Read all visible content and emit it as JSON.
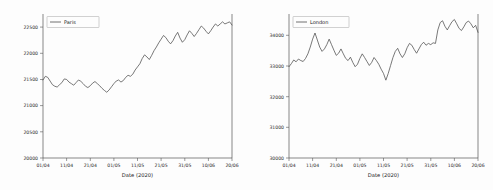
{
  "figure": {
    "background_color": "#fdfdfd",
    "line_color": "#4c4c4c",
    "axis_color": "#555555",
    "panel_count": 2
  },
  "chart_data": [
    {
      "type": "line",
      "title": "",
      "panel": "left",
      "legend": [
        "Paris"
      ],
      "legend_position": "upper left",
      "xlabel": "Date (2020)",
      "ylabel": "",
      "grid": false,
      "xtick_labels": [
        "01/04",
        "11/04",
        "21/04",
        "01/05",
        "11/05",
        "21/05",
        "31/05",
        "10/06",
        "20/06"
      ],
      "ytick_labels": [
        "20000",
        "20500",
        "21000",
        "21500",
        "22000",
        "22500"
      ],
      "ylim": [
        20000,
        22750
      ],
      "xlim": [
        0,
        80
      ],
      "series": [
        {
          "name": "Paris",
          "x": [
            0,
            1,
            2,
            3,
            4,
            5,
            6,
            7,
            8,
            9,
            10,
            11,
            12,
            13,
            14,
            15,
            16,
            17,
            18,
            19,
            20,
            21,
            22,
            23,
            24,
            25,
            26,
            27,
            28,
            29,
            30,
            31,
            32,
            33,
            34,
            35,
            36,
            37,
            38,
            39,
            40,
            41,
            42,
            43,
            44,
            45,
            46,
            47,
            48,
            49,
            50,
            51,
            52,
            53,
            54,
            55,
            56,
            57,
            58,
            59,
            60,
            61,
            62,
            63,
            64,
            65,
            66,
            67,
            68,
            69,
            70,
            71,
            72,
            73,
            74,
            75,
            76,
            77,
            78,
            79,
            80
          ],
          "values": [
            21490,
            21560,
            21540,
            21470,
            21400,
            21370,
            21355,
            21400,
            21440,
            21510,
            21500,
            21450,
            21420,
            21390,
            21440,
            21490,
            21465,
            21420,
            21370,
            21345,
            21380,
            21430,
            21460,
            21420,
            21380,
            21330,
            21290,
            21255,
            21300,
            21360,
            21420,
            21470,
            21490,
            21450,
            21480,
            21540,
            21580,
            21560,
            21600,
            21680,
            21740,
            21800,
            21900,
            21970,
            21930,
            21880,
            21960,
            22050,
            22120,
            22200,
            22270,
            22340,
            22300,
            22230,
            22180,
            22240,
            22330,
            22400,
            22290,
            22210,
            22260,
            22350,
            22430,
            22380,
            22320,
            22380,
            22450,
            22520,
            22480,
            22420,
            22370,
            22430,
            22500,
            22560,
            22520,
            22560,
            22600,
            22560,
            22580,
            22600,
            22540
          ]
        }
      ]
    },
    {
      "type": "line",
      "title": "",
      "panel": "right",
      "legend": [
        "London"
      ],
      "legend_position": "upper left",
      "xlabel": "Date (2020)",
      "ylabel": "",
      "grid": false,
      "xtick_labels": [
        "01/04",
        "11/04",
        "21/04",
        "01/05",
        "11/05",
        "21/05",
        "31/05",
        "10/06",
        "20/06"
      ],
      "ytick_labels": [
        "30000",
        "31000",
        "32000",
        "33000",
        "34000"
      ],
      "ylim": [
        30000,
        34700
      ],
      "xlim": [
        0,
        80
      ],
      "series": [
        {
          "name": "London",
          "x": [
            0,
            1,
            2,
            3,
            4,
            5,
            6,
            7,
            8,
            9,
            10,
            11,
            12,
            13,
            14,
            15,
            16,
            17,
            18,
            19,
            20,
            21,
            22,
            23,
            24,
            25,
            26,
            27,
            28,
            29,
            30,
            31,
            32,
            33,
            34,
            35,
            36,
            37,
            38,
            39,
            40,
            41,
            42,
            43,
            44,
            45,
            46,
            47,
            48,
            49,
            50,
            51,
            52,
            53,
            54,
            55,
            56,
            57,
            58,
            59,
            60,
            61,
            62,
            63,
            64,
            65,
            66,
            67,
            68,
            69,
            70,
            71,
            72,
            73,
            74,
            75,
            76,
            77,
            78,
            79,
            80
          ],
          "values": [
            32980,
            33080,
            33200,
            33140,
            33230,
            33180,
            33150,
            33250,
            33400,
            33620,
            33880,
            34080,
            33850,
            33620,
            33480,
            33560,
            33700,
            33880,
            33700,
            33520,
            33350,
            33420,
            33560,
            33400,
            33250,
            33180,
            33290,
            33120,
            32980,
            33060,
            33250,
            33400,
            33280,
            33150,
            33020,
            33120,
            33280,
            33180,
            33060,
            32900,
            32760,
            32540,
            32760,
            33020,
            33280,
            33480,
            33580,
            33400,
            33280,
            33400,
            33600,
            33740,
            33680,
            33540,
            33420,
            33560,
            33700,
            33780,
            33680,
            33740,
            33700,
            33760,
            33740,
            34180,
            34420,
            34480,
            34300,
            34180,
            34320,
            34450,
            34520,
            34380,
            34230,
            34160,
            34280,
            34420,
            34470,
            34380,
            34250,
            34330,
            34100
          ]
        }
      ]
    }
  ]
}
